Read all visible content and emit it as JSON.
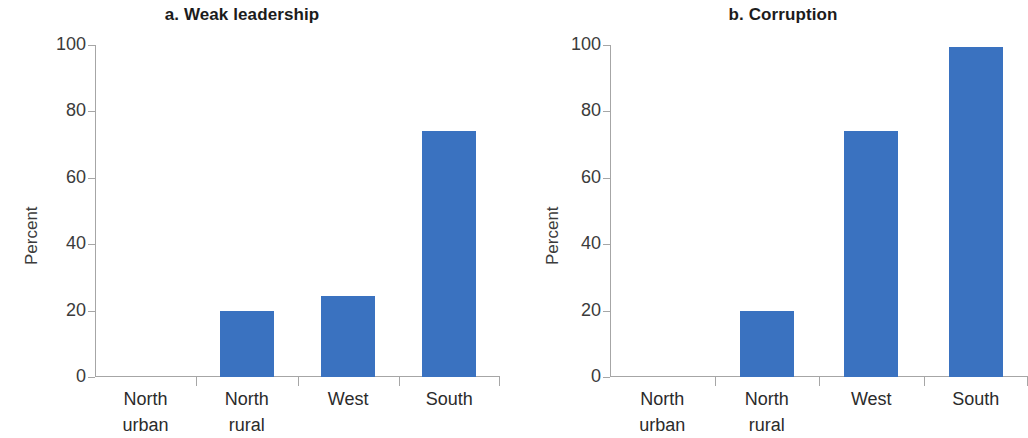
{
  "figure": {
    "background": "#ffffff",
    "bar_color": "#3a72c0",
    "axis_color": "#a6a6a6",
    "text_color": "#2b2b2b"
  },
  "panels": [
    {
      "id": "a",
      "title": "a. Weak leadership",
      "ylabel": "Percent",
      "yticks": [
        "0",
        "20",
        "40",
        "60",
        "80",
        "100"
      ],
      "categories": [
        {
          "line1": "North",
          "line2": "urban"
        },
        {
          "line1": "North",
          "line2": "rural"
        },
        {
          "line1": "West",
          "line2": ""
        },
        {
          "line1": "South",
          "line2": ""
        }
      ]
    },
    {
      "id": "b",
      "title": "b. Corruption",
      "ylabel": "Percent",
      "yticks": [
        "0",
        "20",
        "40",
        "60",
        "80",
        "100"
      ],
      "categories": [
        {
          "line1": "North",
          "line2": "urban"
        },
        {
          "line1": "North",
          "line2": "rural"
        },
        {
          "line1": "West",
          "line2": ""
        },
        {
          "line1": "South",
          "line2": ""
        }
      ]
    }
  ],
  "chart_data": [
    {
      "type": "bar",
      "title": "a. Weak leadership",
      "xlabel": "",
      "ylabel": "Percent",
      "categories": [
        "North urban",
        "North rural",
        "West",
        "South"
      ],
      "values": [
        0,
        19.8,
        24.5,
        74.0
      ],
      "ylim": [
        0,
        100
      ],
      "yticks": [
        0,
        20,
        40,
        60,
        80,
        100
      ],
      "grid": false,
      "legend": false,
      "bar_color": "#3a72c0"
    },
    {
      "type": "bar",
      "title": "b. Corruption",
      "xlabel": "",
      "ylabel": "Percent",
      "categories": [
        "North urban",
        "North rural",
        "West",
        "South"
      ],
      "values": [
        0,
        20.0,
        74.0,
        99.5
      ],
      "ylim": [
        0,
        100
      ],
      "yticks": [
        0,
        20,
        40,
        60,
        80,
        100
      ],
      "grid": false,
      "legend": false,
      "bar_color": "#3a72c0"
    }
  ]
}
